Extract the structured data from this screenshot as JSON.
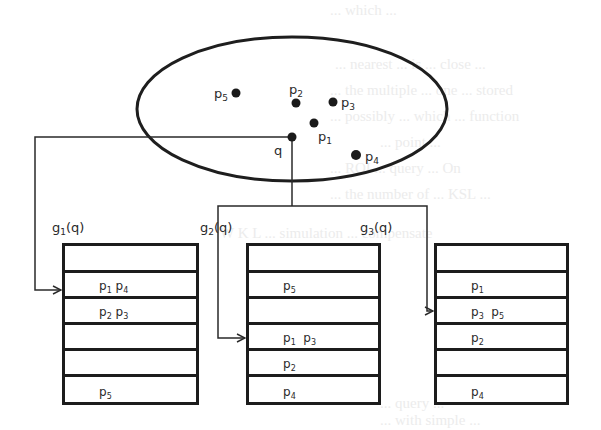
{
  "diagram": {
    "query_point": {
      "label": "q",
      "x": 292,
      "y": 137
    },
    "points": [
      {
        "id": "p1",
        "label": "p",
        "sub": "1",
        "x": 314,
        "y": 123,
        "label_dx": 4,
        "label_dy": 18
      },
      {
        "id": "p2",
        "label": "p",
        "sub": "2",
        "x": 296,
        "y": 103,
        "label_dx": -6,
        "label_dy": -9
      },
      {
        "id": "p3",
        "label": "p",
        "sub": "3",
        "x": 333,
        "y": 102,
        "label_dx": 8,
        "label_dy": 5
      },
      {
        "id": "p4",
        "label": "p",
        "sub": "4",
        "x": 356,
        "y": 155,
        "label_dx": 8,
        "label_dy": 6
      },
      {
        "id": "p5",
        "label": "p",
        "sub": "5",
        "x": 236,
        "y": 93,
        "label_dx": -22,
        "label_dy": 5
      }
    ],
    "ellipse": {
      "cx": 292,
      "cy": 109,
      "rx": 155,
      "ry": 72
    },
    "functions": [
      {
        "id": "g1",
        "label": "g",
        "sub": "1",
        "arg": "(q)"
      },
      {
        "id": "g2",
        "label": "g",
        "sub": "2",
        "arg": "(q)"
      },
      {
        "id": "g3",
        "label": "g",
        "sub": "3",
        "arg": "(q)"
      }
    ],
    "tables": [
      {
        "id": "table-g1",
        "rows": [
          [],
          [
            {
              "p": "p",
              "s": "1"
            },
            {
              "p": "p",
              "s": "4"
            }
          ],
          [
            {
              "p": "p",
              "s": "2"
            },
            {
              "p": "p",
              "s": "3"
            }
          ],
          [],
          [],
          [
            {
              "p": "p",
              "s": "5"
            }
          ]
        ],
        "target_row": 1
      },
      {
        "id": "table-g2",
        "rows": [
          [],
          [
            {
              "p": "p",
              "s": "5"
            }
          ],
          [],
          [
            {
              "p": "p",
              "s": "1"
            },
            {
              "p": "p",
              "s": "3"
            }
          ],
          [
            {
              "p": "p",
              "s": "2"
            }
          ],
          [
            {
              "p": "p",
              "s": "4"
            }
          ]
        ],
        "target_row": 3
      },
      {
        "id": "table-g3",
        "rows": [
          [],
          [
            {
              "p": "p",
              "s": "1"
            }
          ],
          [
            {
              "p": "p",
              "s": "3"
            },
            {
              "p": "p",
              "s": "5"
            }
          ],
          [
            {
              "p": "p",
              "s": "2"
            }
          ],
          [],
          [
            {
              "p": "p",
              "s": "4"
            }
          ]
        ],
        "target_row": 2
      }
    ]
  }
}
